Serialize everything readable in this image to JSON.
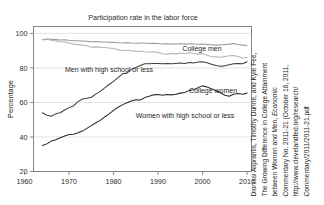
{
  "figure": {
    "title": "Participation rate in the labor force",
    "ylabel": "Percentage"
  },
  "citation": {
    "lines": [
      "Dionissi Aliprantis, Timothy Dunne, and Kyle Fee,",
      "The Growing Difference in College Attainment",
      "between Women and Men, Economic",
      "Commentary No. 2011-21 (October 18, 2011,",
      "http://www.clevelandfed.org/research/",
      "Commentary/2011/2011-21.pdf"
    ]
  },
  "annotations": {
    "college_men": "College men",
    "men_hs": "Men with high school or less",
    "college_women": "College women",
    "women_hs": "Women with high school or less"
  },
  "chart_data": {
    "type": "line",
    "title": "Participation rate in the labor force",
    "xlabel": "",
    "ylabel": "Percentage",
    "xlim": [
      1962,
      2011
    ],
    "ylim": [
      20,
      104
    ],
    "yticks": [
      20,
      40,
      60,
      80,
      100
    ],
    "xticks": [
      1960,
      1970,
      1980,
      1990,
      2000,
      2010
    ],
    "grid": "horizontal",
    "legend": "inline-annotations",
    "colors": {
      "college_men": "#9a9a9a",
      "men_hs": "#b5b5b5",
      "college_women": "#3f3f3f",
      "women_hs": "#2a2a2a"
    },
    "x": [
      1964,
      1965,
      1966,
      1967,
      1968,
      1969,
      1970,
      1971,
      1972,
      1973,
      1974,
      1975,
      1976,
      1977,
      1978,
      1979,
      1980,
      1981,
      1982,
      1983,
      1984,
      1985,
      1986,
      1987,
      1988,
      1989,
      1990,
      1991,
      1992,
      1993,
      1994,
      1995,
      1996,
      1997,
      1998,
      1999,
      2000,
      2001,
      2002,
      2003,
      2004,
      2005,
      2006,
      2007,
      2008,
      2009,
      2010
    ],
    "series": [
      {
        "name": "College men",
        "values": [
          96.5,
          96.8,
          96.6,
          96.4,
          96.2,
          96.3,
          96.0,
          95.8,
          95.7,
          95.6,
          95.5,
          95.2,
          95.3,
          95.1,
          95.0,
          94.9,
          94.8,
          94.6,
          94.5,
          94.6,
          94.4,
          94.3,
          94.5,
          94.4,
          94.2,
          94.3,
          94.1,
          93.9,
          94.0,
          93.8,
          93.9,
          94.0,
          93.8,
          94.0,
          93.9,
          93.7,
          93.8,
          93.6,
          93.4,
          93.2,
          93.4,
          93.5,
          93.8,
          94.2,
          93.6,
          93.2,
          93.0
        ]
      },
      {
        "name": "Men with high school or less",
        "values": [
          96.2,
          96.6,
          96.0,
          95.6,
          95.2,
          95.0,
          94.4,
          93.8,
          93.5,
          93.2,
          92.8,
          92.0,
          92.2,
          92.0,
          91.8,
          91.6,
          91.2,
          90.6,
          90.0,
          90.2,
          90.0,
          89.6,
          89.8,
          89.4,
          89.2,
          89.4,
          89.0,
          88.2,
          88.0,
          88.4,
          88.0,
          88.6,
          88.2,
          88.8,
          88.4,
          88.0,
          88.2,
          87.4,
          86.6,
          86.4,
          86.2,
          86.6,
          87.0,
          87.2,
          86.6,
          85.8,
          86.0
        ]
      },
      {
        "name": "College women",
        "values": [
          54.0,
          52.6,
          52.0,
          53.4,
          54.0,
          55.6,
          57.0,
          58.0,
          60.5,
          62.0,
          62.4,
          63.0,
          64.8,
          66.4,
          68.4,
          70.4,
          72.2,
          74.4,
          76.6,
          77.0,
          79.2,
          80.2,
          81.4,
          82.4,
          82.4,
          82.6,
          82.6,
          82.4,
          82.6,
          82.4,
          82.6,
          82.8,
          82.6,
          83.2,
          82.8,
          83.4,
          83.6,
          83.0,
          82.2,
          81.4,
          81.0,
          81.2,
          81.8,
          82.4,
          82.6,
          82.4,
          83.6
        ]
      },
      {
        "name": "Women with high school or less",
        "values": [
          35.0,
          36.0,
          37.6,
          38.4,
          39.6,
          40.6,
          41.4,
          41.6,
          42.4,
          43.4,
          45.0,
          46.6,
          48.2,
          49.6,
          51.6,
          53.4,
          55.4,
          57.2,
          58.6,
          59.8,
          60.8,
          61.6,
          61.4,
          62.8,
          63.6,
          64.4,
          64.6,
          64.2,
          64.6,
          64.4,
          64.8,
          65.4,
          65.8,
          67.0,
          67.4,
          68.6,
          69.6,
          69.0,
          68.0,
          66.8,
          65.6,
          64.2,
          63.6,
          64.8,
          65.2,
          64.8,
          65.4
        ]
      }
    ]
  }
}
